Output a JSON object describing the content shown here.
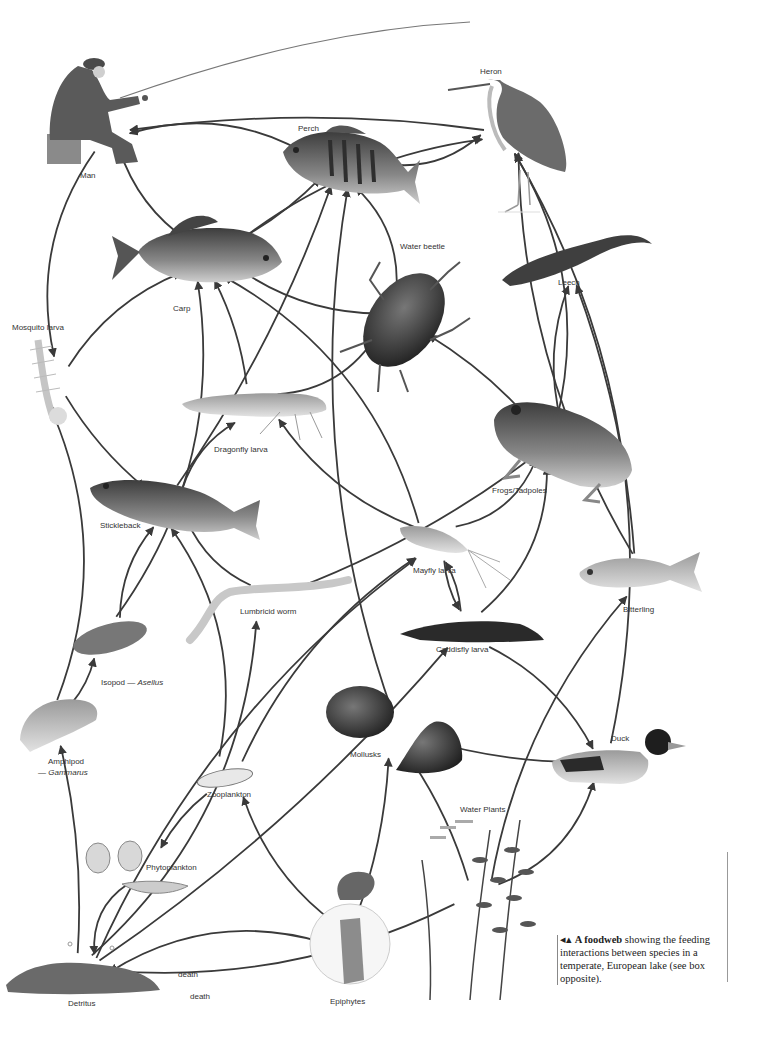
{
  "diagram": {
    "title": "A foodweb",
    "type": "food web",
    "nodes": [
      {
        "id": "man",
        "label": "Man"
      },
      {
        "id": "heron",
        "label": "Heron"
      },
      {
        "id": "perch",
        "label": "Perch"
      },
      {
        "id": "carp",
        "label": "Carp"
      },
      {
        "id": "water_beetle",
        "label": "Water beetle"
      },
      {
        "id": "leech",
        "label": "Leech"
      },
      {
        "id": "mosquito_larva",
        "label": "Mosquito larva"
      },
      {
        "id": "dragonfly_larva",
        "label": "Dragonfly larva"
      },
      {
        "id": "frogs",
        "label": "Frogs/Tadpoles"
      },
      {
        "id": "stickleback",
        "label": "Stickleback"
      },
      {
        "id": "mayfly_larva",
        "label": "Mayfly larva"
      },
      {
        "id": "bitterling",
        "label": "Bitterling"
      },
      {
        "id": "lumbricid_worm",
        "label": "Lumbricid worm"
      },
      {
        "id": "caddisfly_larva",
        "label": "Caddisfly larva"
      },
      {
        "id": "isopod",
        "label": "Isopod — ",
        "label_italic": "Asellus"
      },
      {
        "id": "amphipod",
        "label": "Amphipod",
        "label_line2": "— ",
        "label_italic": "Gammarus"
      },
      {
        "id": "mollusks",
        "label": "Mollusks"
      },
      {
        "id": "duck",
        "label": "Duck"
      },
      {
        "id": "zooplankton",
        "label": "Zooplankton"
      },
      {
        "id": "water_plants",
        "label": "Water Plants"
      },
      {
        "id": "phytoplankton",
        "label": "Phytoplankton"
      },
      {
        "id": "detritus",
        "label": "Detritus"
      },
      {
        "id": "epiphytes",
        "label": "Epiphytes"
      }
    ],
    "edges": [
      {
        "from": "perch",
        "to": "man"
      },
      {
        "from": "carp",
        "to": "man"
      },
      {
        "from": "heron",
        "to": "man"
      },
      {
        "from": "perch",
        "to": "heron"
      },
      {
        "from": "carp",
        "to": "heron"
      },
      {
        "from": "carp",
        "to": "perch"
      },
      {
        "from": "man",
        "to": "mosquito_larva"
      },
      {
        "from": "mosquito_larva",
        "to": "carp"
      },
      {
        "from": "mosquito_larva",
        "to": "stickleback"
      },
      {
        "from": "water_beetle",
        "to": "perch"
      },
      {
        "from": "water_beetle",
        "to": "carp"
      },
      {
        "from": "dragonfly_larva",
        "to": "carp"
      },
      {
        "from": "dragonfly_larva",
        "to": "water_beetle"
      },
      {
        "from": "stickleback",
        "to": "dragonfly_larva"
      },
      {
        "from": "stickleback",
        "to": "perch"
      },
      {
        "from": "frogs",
        "to": "heron"
      },
      {
        "from": "frogs",
        "to": "leech"
      },
      {
        "from": "frogs",
        "to": "water_beetle"
      },
      {
        "from": "mayfly_larva",
        "to": "carp"
      },
      {
        "from": "mayfly_larva",
        "to": "dragonfly_larva"
      },
      {
        "from": "mayfly_larva",
        "to": "caddisfly_larva"
      },
      {
        "from": "mayfly_larva",
        "to": "frogs"
      },
      {
        "from": "lumbricid_worm",
        "to": "stickleback"
      },
      {
        "from": "lumbricid_worm",
        "to": "frogs"
      },
      {
        "from": "isopod",
        "to": "carp"
      },
      {
        "from": "isopod",
        "to": "stickleback"
      },
      {
        "from": "amphipod",
        "to": "isopod"
      },
      {
        "from": "amphipod",
        "to": "mosquito_larva"
      },
      {
        "from": "caddisfly_larva",
        "to": "duck"
      },
      {
        "from": "caddisfly_larva",
        "to": "mayfly_larva"
      },
      {
        "from": "caddisfly_larva",
        "to": "frogs"
      },
      {
        "from": "mollusks",
        "to": "perch"
      },
      {
        "from": "mollusks",
        "to": "duck"
      },
      {
        "from": "duck",
        "to": "heron"
      },
      {
        "from": "bitterling",
        "to": "heron"
      },
      {
        "from": "bitterling",
        "to": "leech"
      },
      {
        "from": "zooplankton",
        "to": "stickleback"
      },
      {
        "from": "zooplankton",
        "to": "mayfly_larva"
      },
      {
        "from": "zooplankton",
        "to": "phytoplankton"
      },
      {
        "from": "phytoplankton",
        "to": "detritus"
      },
      {
        "from": "epiphytes",
        "to": "zooplankton"
      },
      {
        "from": "epiphytes",
        "to": "mollusks"
      },
      {
        "from": "epiphytes",
        "to": "detritus",
        "label": "death"
      },
      {
        "from": "water_plants",
        "to": "detritus",
        "label": "death"
      },
      {
        "from": "water_plants",
        "to": "mollusks"
      },
      {
        "from": "water_plants",
        "to": "duck"
      },
      {
        "from": "water_plants",
        "to": "bitterling"
      },
      {
        "from": "detritus",
        "to": "amphipod"
      },
      {
        "from": "detritus",
        "to": "lumbricid_worm"
      },
      {
        "from": "detritus",
        "to": "mayfly_larva"
      },
      {
        "from": "detritus",
        "to": "caddisfly_larva"
      }
    ],
    "edge_labels": {
      "death_1": "death",
      "death_2": "death"
    }
  },
  "caption": {
    "marker": "◂▴",
    "bold": "A foodweb",
    "text": " showing the feeding interactions between species in a temperate, European lake (see box opposite)."
  }
}
